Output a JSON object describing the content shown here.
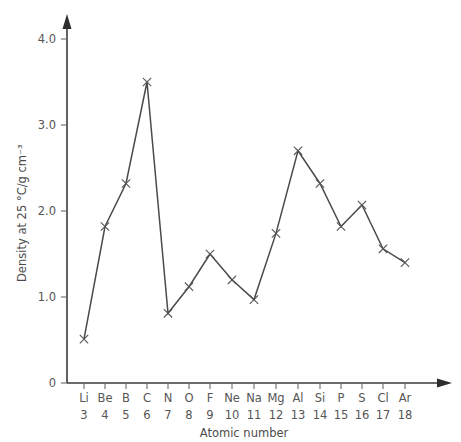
{
  "chart_data": {
    "type": "line",
    "title": "",
    "xlabel": "Atomic number",
    "ylabel": "Density at 25 °C/g cm⁻³",
    "categories": [
      "Li",
      "Be",
      "B",
      "C",
      "N",
      "O",
      "F",
      "Ne",
      "Na",
      "Mg",
      "Al",
      "Si",
      "P",
      "S",
      "Cl",
      "Ar"
    ],
    "x": [
      3,
      4,
      5,
      6,
      7,
      8,
      9,
      10,
      11,
      12,
      13,
      14,
      15,
      16,
      17,
      18
    ],
    "values": [
      0.51,
      1.82,
      2.32,
      3.5,
      0.81,
      1.12,
      1.5,
      1.2,
      0.97,
      1.74,
      2.7,
      2.32,
      1.82,
      2.07,
      1.56,
      1.4
    ],
    "ylim": [
      0,
      4.3
    ],
    "yticks": [
      0,
      1.0,
      2.0,
      3.0,
      4.0
    ],
    "ytick_labels": [
      "0",
      "1.0",
      "2.0",
      "3.0",
      "4.0"
    ],
    "grid": false,
    "legend": "none",
    "marker": "x",
    "line_color": "#4a4a4a",
    "marker_color": "#555555",
    "axis_color": "#3a3a3a",
    "background": "#ffffff"
  },
  "axes": {
    "y_tick_labels": [
      "4.0",
      "3.0",
      "2.0",
      "1.0",
      "0"
    ],
    "x_symbols": [
      "Li",
      "Be",
      "B",
      "C",
      "N",
      "O",
      "F",
      "Ne",
      "Na",
      "Mg",
      "Al",
      "Si",
      "P",
      "S",
      "Cl",
      "Ar"
    ],
    "x_numbers": [
      "3",
      "4",
      "5",
      "6",
      "7",
      "8",
      "9",
      "10",
      "11",
      "12",
      "13",
      "14",
      "15",
      "16",
      "17",
      "18"
    ],
    "x_axis_title": "Atomic number",
    "y_axis_title": "Density at 25 °C/g cm⁻³"
  }
}
